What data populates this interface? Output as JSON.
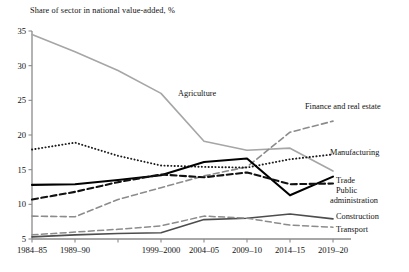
{
  "chart_data": {
    "type": "line",
    "title": "Share of sector in national value-added, %",
    "xlabel": "",
    "ylabel": "Share of sector in national value-added, %",
    "ylim": [
      5,
      35
    ],
    "yticks": [
      5,
      10,
      15,
      20,
      25,
      30,
      35
    ],
    "grid": false,
    "legend_position": "inline-right-labels",
    "x": [
      "1984–85",
      "1989–90",
      "",
      "1999–2000",
      "2004–05",
      "2009–10",
      "2014–15",
      "2019–20"
    ],
    "xtick_labels": [
      "1984–85",
      "1989–90",
      "",
      "1999–2000",
      "2004–05",
      "2009–10",
      "2014–15",
      "2019–20"
    ],
    "series": [
      {
        "name": "Agriculture",
        "label": "Agriculture",
        "style": "solid",
        "color": "#a6a6a6",
        "width": 1.6,
        "values": [
          34.5,
          32.0,
          29.3,
          26.0,
          19.1,
          17.8,
          18.1,
          14.8
        ]
      },
      {
        "name": "Finance and real estate",
        "label": "Finance and real estate",
        "style": "dashed",
        "color": "#8c8c8c",
        "width": 1.6,
        "values": [
          8.3,
          8.2,
          10.7,
          12.4,
          14.1,
          15.4,
          20.4,
          22.0
        ]
      },
      {
        "name": "Manufacturing",
        "label": "Manufacturing",
        "style": "dotted",
        "color": "#1a1a1a",
        "width": 1.9,
        "values": [
          17.9,
          18.9,
          17.0,
          15.6,
          15.4,
          15.3,
          16.5,
          17.2
        ]
      },
      {
        "name": "Trade",
        "label": "Trade",
        "style": "solid",
        "color": "#000000",
        "width": 2.1,
        "values": [
          12.8,
          12.9,
          13.5,
          14.2,
          16.1,
          16.6,
          11.3,
          14.0
        ]
      },
      {
        "name": "Public administration",
        "label": "Public administration",
        "style": "dashed",
        "color": "#111111",
        "width": 2.1,
        "values": [
          10.7,
          11.8,
          13.2,
          14.3,
          13.9,
          14.6,
          12.9,
          13.0
        ]
      },
      {
        "name": "Construction",
        "label": "Construction",
        "style": "solid",
        "color": "#4d4d4d",
        "width": 1.6,
        "values": [
          5.3,
          5.6,
          5.8,
          5.9,
          7.8,
          8.0,
          8.6,
          7.9
        ]
      },
      {
        "name": "Transport",
        "label": "Transport",
        "style": "dashed",
        "color": "#8c8c8c",
        "width": 1.5,
        "values": [
          5.6,
          6.0,
          6.4,
          6.9,
          8.3,
          8.0,
          7.0,
          6.7
        ]
      }
    ],
    "inline_labels": [
      {
        "text": "Agriculture",
        "x": 178,
        "y": 96,
        "anchor": "start"
      },
      {
        "text": "Finance and real estate",
        "x": 305,
        "y": 109,
        "anchor": "start"
      },
      {
        "text": "Manufacturing",
        "x": 330,
        "y": 155,
        "anchor": "start"
      },
      {
        "text": "Trade",
        "x": 336,
        "y": 183,
        "anchor": "start"
      },
      {
        "text": "Public",
        "x": 336,
        "y": 193,
        "anchor": "start"
      },
      {
        "text": "administration",
        "x": 330,
        "y": 203,
        "anchor": "start"
      },
      {
        "text": "Construction",
        "x": 336,
        "y": 219,
        "anchor": "start"
      },
      {
        "text": "Transport",
        "x": 336,
        "y": 232,
        "anchor": "start"
      }
    ]
  }
}
